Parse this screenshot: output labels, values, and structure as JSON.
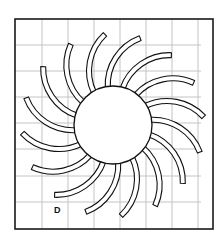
{
  "diagram": {
    "label": "D",
    "label_pos": {
      "x": 54,
      "y": 205
    },
    "frame": {
      "x": 15,
      "y": 19,
      "width": 198,
      "height": 210,
      "stroke": "#1a1a1a",
      "stroke_width": 1.6
    },
    "grid": {
      "color": "#c4c4c4",
      "vertical_x": [
        42,
        68,
        94,
        120,
        146,
        172,
        198
      ],
      "horizontal_y": [
        45,
        71,
        97,
        123,
        149,
        176,
        202
      ],
      "x_extent": [
        15,
        201
      ],
      "y_extent": [
        19,
        229
      ]
    },
    "sun": {
      "cx": 113,
      "cy": 125,
      "r": 39,
      "fill": "#ffffff",
      "stroke": "#111111"
    },
    "rays": {
      "count": 16,
      "center_offset": 60,
      "center_angle_deg": -19.3,
      "arc_radius": 50,
      "strip_width": 5,
      "start_angle_deg": 199,
      "end_angle_deg": 272,
      "rotation_start_deg": 0,
      "fill": "#ffffff",
      "stroke": "#111111"
    }
  }
}
